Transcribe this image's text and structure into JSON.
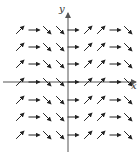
{
  "diagram": {
    "type": "direction-field",
    "axes": {
      "x_label": "x",
      "y_label": "y",
      "origin_px": [
        68,
        82
      ],
      "x_axis": {
        "from": 3,
        "to": 136
      },
      "y_axis": {
        "from": 152,
        "to": 13
      },
      "color": "#555555"
    },
    "arrow_color": "#222222",
    "column_x_px": [
      20,
      34,
      47,
      60,
      73,
      88,
      101,
      115,
      128
    ],
    "column_directions": [
      "up-right",
      "right",
      "down-right",
      "down-right",
      "right",
      "up-right",
      "up-right",
      "right",
      "down-right"
    ],
    "row_y_px": [
      30,
      47,
      64,
      82,
      100,
      117,
      135
    ]
  }
}
